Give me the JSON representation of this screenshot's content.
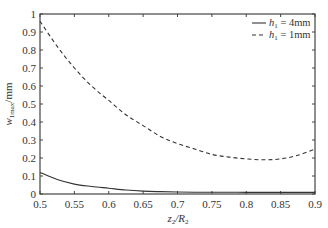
{
  "chart_data": {
    "type": "line",
    "title": "",
    "xlabel": "z2/R2",
    "ylabel": "w1max/mm",
    "xlim": [
      0.5,
      0.9
    ],
    "ylim": [
      0,
      1
    ],
    "grid": false,
    "legend_position": "upper right",
    "x_ticks": [
      "0.5",
      "0.55",
      "0.6",
      "0.65",
      "0.7",
      "0.75",
      "0.8",
      "0.85",
      "0.9"
    ],
    "y_ticks": [
      "0",
      "0.1",
      "0.2",
      "0.3",
      "0.4",
      "0.5",
      "0.6",
      "0.7",
      "0.8",
      "0.9",
      "1"
    ],
    "x": [
      0.5,
      0.525,
      0.55,
      0.575,
      0.6,
      0.625,
      0.65,
      0.675,
      0.7,
      0.725,
      0.75,
      0.775,
      0.8,
      0.825,
      0.85,
      0.875,
      0.9
    ],
    "series": [
      {
        "name": "h1 = 4mm",
        "style": "solid",
        "values": [
          0.12,
          0.08,
          0.055,
          0.042,
          0.032,
          0.022,
          0.016,
          0.013,
          0.011,
          0.01,
          0.01,
          0.01,
          0.009,
          0.009,
          0.009,
          0.009,
          0.009
        ]
      },
      {
        "name": "h1 = 1mm",
        "style": "dashed",
        "values": [
          0.96,
          0.82,
          0.7,
          0.6,
          0.52,
          0.44,
          0.38,
          0.32,
          0.28,
          0.25,
          0.22,
          0.205,
          0.195,
          0.19,
          0.195,
          0.215,
          0.25
        ]
      }
    ]
  },
  "legend": {
    "items": [
      {
        "prefix": "h",
        "sub": "1",
        "suffix": " = 4mm"
      },
      {
        "prefix": "h",
        "sub": "1",
        "suffix": " = 1mm"
      }
    ]
  },
  "axes": {
    "x_title": {
      "main": "z",
      "sub1": "2",
      "mid": "/R",
      "sub2": "2"
    },
    "y_title": {
      "main": "w",
      "sub": "1max",
      "suffix": "/mm"
    }
  }
}
